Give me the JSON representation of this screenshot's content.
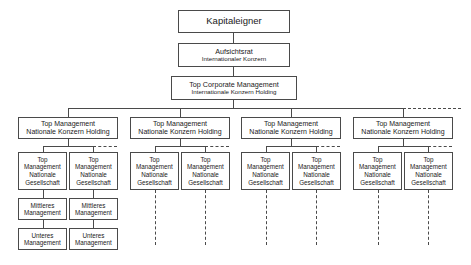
{
  "diagram": {
    "title_text": "Konzern Organigramm",
    "root": {
      "label": "Kapitaleigner"
    },
    "supervisory": {
      "line1": "Aufsichtsrat",
      "line2": "Internationaler Konzern"
    },
    "top_corporate": {
      "line1": "Top Corporate Management",
      "line2": "Internationale Konzern Holding"
    },
    "holding_label": {
      "line1": "Top Management",
      "line2": "Nationale Konzern Holding"
    },
    "gesellschaft_label": {
      "line1": "Top",
      "line2": "Management",
      "line3": "Nationale",
      "line4": "Gesellschaft"
    },
    "middle_label": {
      "line1": "Mittleres",
      "line2": "Management"
    },
    "lower_label": {
      "line1": "Unteres",
      "line2": "Management"
    },
    "colors": {
      "stroke": "#4a4a4a",
      "fill": "#ffffff",
      "text": "#1a1a1a"
    },
    "columns": [
      {
        "index": 1,
        "holding_line1": "Top Management",
        "holding_line2": "Nationale Konzern Holding",
        "children": [
          {
            "g_line1": "Top",
            "g_line2": "Management",
            "g_line3": "Nationale",
            "g_line4": "Gesellschaft",
            "mid_line1": "Mittleres",
            "mid_line2": "Management",
            "low_line1": "Unteres",
            "low_line2": "Management",
            "expanded": "true"
          },
          {
            "g_line1": "Top",
            "g_line2": "Management",
            "g_line3": "Nationale",
            "g_line4": "Gesellschaft",
            "mid_line1": "Mittleres",
            "mid_line2": "Management",
            "low_line1": "Unteres",
            "low_line2": "Management",
            "expanded": "true"
          }
        ]
      },
      {
        "index": 2,
        "holding_line1": "Top Management",
        "holding_line2": "Nationale Konzern Holding",
        "children": [
          {
            "g_line1": "Top",
            "g_line2": "Management",
            "g_line3": "Nationale",
            "g_line4": "Gesellschaft",
            "expanded": "false"
          },
          {
            "g_line1": "Top",
            "g_line2": "Management",
            "g_line3": "Nationale",
            "g_line4": "Gesellschaft",
            "expanded": "false"
          }
        ]
      },
      {
        "index": 3,
        "holding_line1": "Top Management",
        "holding_line2": "Nationale Konzern Holding",
        "children": [
          {
            "g_line1": "Top",
            "g_line2": "Management",
            "g_line3": "Nationale",
            "g_line4": "Gesellschaft",
            "expanded": "false"
          },
          {
            "g_line1": "Top",
            "g_line2": "Management",
            "g_line3": "Nationale",
            "g_line4": "Gesellschaft",
            "expanded": "false"
          }
        ]
      },
      {
        "index": 4,
        "holding_line1": "Top Management",
        "holding_line2": "Nationale Konzern Holding",
        "children": [
          {
            "g_line1": "Top",
            "g_line2": "Management",
            "g_line3": "Nationale",
            "g_line4": "Gesellschaft",
            "expanded": "false"
          },
          {
            "g_line1": "Top",
            "g_line2": "Management",
            "g_line3": "Nationale",
            "g_line4": "Gesellschaft",
            "expanded": "false"
          }
        ]
      }
    ]
  }
}
